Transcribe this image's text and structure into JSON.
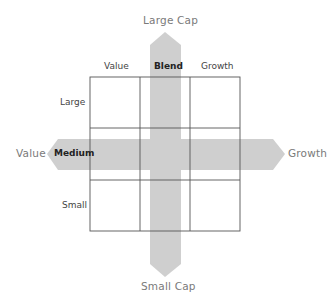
{
  "diagram": {
    "type": "style-box",
    "axes": {
      "top": "Large Cap",
      "bottom": "Small Cap",
      "left": "Value",
      "right": "Growth"
    },
    "columns": [
      "Value",
      "Blend",
      "Growth"
    ],
    "rows": [
      "Large",
      "Medium",
      "Small"
    ],
    "highlight": {
      "column": "Blend",
      "row": "Medium"
    },
    "colors": {
      "arrow": "#cfcfcf",
      "grid_line": "#555555",
      "axis_label": "#7a7a7a"
    }
  }
}
